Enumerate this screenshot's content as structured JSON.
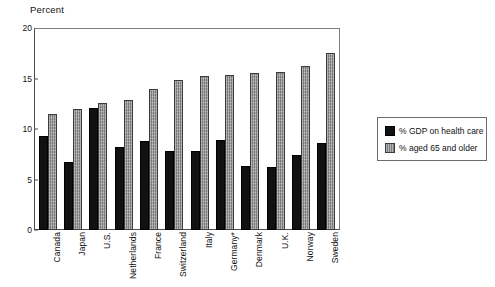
{
  "chart_data": {
    "type": "bar",
    "title": "",
    "ylabel": "Percent",
    "xlabel": "",
    "ylim": [
      0,
      20
    ],
    "yticks": [
      0,
      5,
      10,
      15,
      20
    ],
    "grid": false,
    "legend_position": "right-outside",
    "categories": [
      "Canada",
      "Japan",
      "U.S.",
      "Netherlands",
      "France",
      "Switzerland",
      "Italy",
      "Germany*",
      "Denmark",
      "U.K.",
      "Norway",
      "Sweden"
    ],
    "series": [
      {
        "name": "% GDP on health care",
        "color": "#111111",
        "values": [
          9.3,
          6.7,
          12.1,
          8.2,
          8.8,
          7.8,
          7.8,
          8.9,
          6.3,
          6.2,
          7.4,
          8.6
        ]
      },
      {
        "name": "% aged 65 and older",
        "color": "#8e8e8e",
        "values": [
          11.5,
          12.0,
          12.6,
          12.9,
          14.0,
          14.9,
          15.2,
          15.3,
          15.5,
          15.6,
          16.2,
          17.5
        ]
      }
    ]
  },
  "legend": {
    "entries": [
      {
        "label": "% GDP on health care",
        "swatch": "dark"
      },
      {
        "label": "% aged 65 and older",
        "swatch": "light"
      }
    ]
  }
}
